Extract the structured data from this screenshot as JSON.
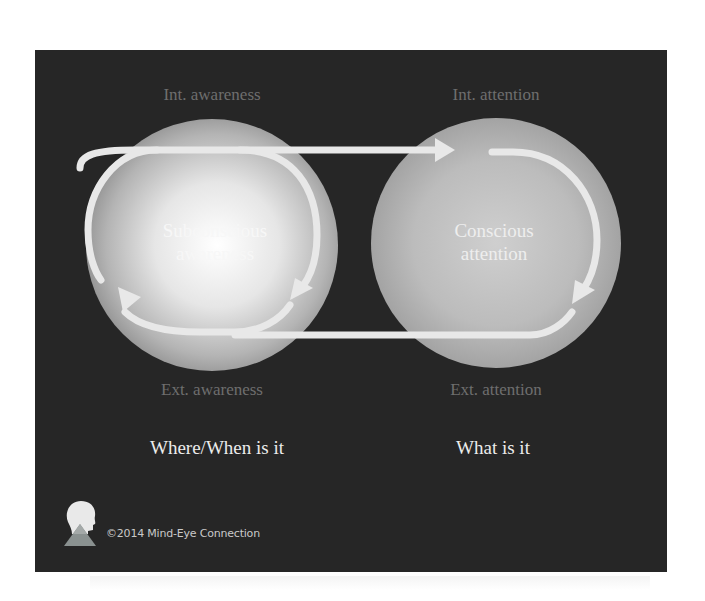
{
  "labels": {
    "int_awareness": "Int. awareness",
    "int_attention": "Int. attention",
    "ext_awareness": "Ext. awareness",
    "ext_attention": "Ext. attention"
  },
  "circles": {
    "left": {
      "line1": "Subconscious",
      "line2": "awareness"
    },
    "right": {
      "line1": "Conscious",
      "line2": "attention"
    }
  },
  "questions": {
    "left": "Where/When is it",
    "right": "What is it"
  },
  "footer": {
    "copyright": "©2014 Mind-Eye Connection",
    "logo_icon": "head-pyramid-logo-icon"
  },
  "colors": {
    "slide_bg": "#262626",
    "dim_label": "#6e6e6e",
    "question_text": "#ececec",
    "arrow": "#e6e6e6"
  }
}
